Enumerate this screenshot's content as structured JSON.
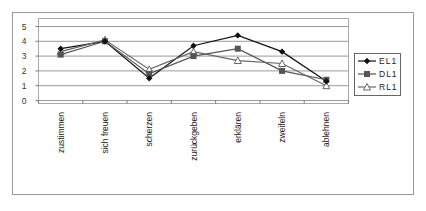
{
  "chart_data": {
    "type": "line",
    "title": "",
    "xlabel": "",
    "ylabel": "",
    "ylim": [
      0,
      5
    ],
    "yticks": [
      0,
      1,
      2,
      3,
      4,
      5
    ],
    "grid": true,
    "legend_position": "right",
    "categories": [
      "zustimmen",
      "sich freuen",
      "scherzen",
      "zurückgeben",
      "erklären",
      "zweifeln",
      "ablehnen"
    ],
    "series": [
      {
        "name": "EL1",
        "marker": "diamond",
        "color": "#111111",
        "values": [
          3.5,
          4.0,
          1.5,
          3.7,
          4.4,
          3.3,
          1.3
        ]
      },
      {
        "name": "DL1",
        "marker": "square",
        "color": "#555555",
        "values": [
          3.1,
          4.0,
          1.8,
          3.0,
          3.5,
          2.0,
          1.4
        ]
      },
      {
        "name": "RL1",
        "marker": "triangle",
        "color": "#666666",
        "values": [
          3.3,
          4.1,
          2.1,
          3.3,
          2.7,
          2.5,
          1.0
        ]
      }
    ]
  }
}
